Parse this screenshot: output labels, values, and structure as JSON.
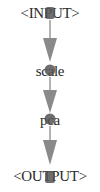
{
  "diagram": {
    "type": "pipeline-graph",
    "orientation": "vertical",
    "colors": {
      "background": "#ffffff",
      "edge": "#808080",
      "arrowhead": "#8a8a8a",
      "node_marker": "#505050",
      "label_text": "#2a2a2a"
    },
    "nodes": [
      {
        "id": "input",
        "label": "<INPUT>"
      },
      {
        "id": "scale",
        "label": "scale"
      },
      {
        "id": "pca",
        "label": "pca"
      },
      {
        "id": "output",
        "label": "<OUTPUT>"
      }
    ],
    "edges": [
      {
        "from": "input",
        "to": "scale"
      },
      {
        "from": "scale",
        "to": "pca"
      },
      {
        "from": "pca",
        "to": "output"
      }
    ]
  }
}
